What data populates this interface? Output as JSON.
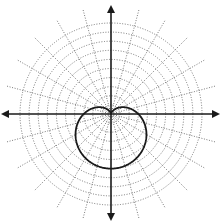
{
  "diagram": {
    "type": "polar-plot",
    "grid": {
      "circle_count": 10,
      "ray_angle_step_degrees": 15,
      "line_style": "dotted",
      "line_color": "#6a6a6a"
    },
    "axes": {
      "horizontal": {
        "arrows": [
          "left",
          "right"
        ]
      },
      "vertical": {
        "arrows": [
          "up",
          "down"
        ]
      },
      "color": "#1a1a1a"
    },
    "curve": {
      "name": "cardioid",
      "equation": "r = a(1 - sin θ)",
      "a_in_grid_units": 3,
      "orientation": "opens downward, cusp at origin",
      "color": "#1a1a1a"
    }
  }
}
